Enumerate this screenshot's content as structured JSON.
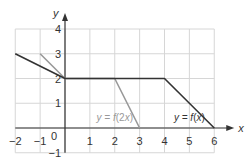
{
  "chart_data": {
    "type": "line",
    "title": "",
    "xlabel": "x",
    "ylabel": "y",
    "xlim": [
      -2,
      6
    ],
    "ylim": [
      -1,
      4
    ],
    "grid": true,
    "x_ticks": [
      -2,
      -1,
      1,
      2,
      3,
      4,
      5,
      6
    ],
    "y_ticks": [
      -1,
      1,
      2,
      3,
      4
    ],
    "origin_label": "0",
    "series": [
      {
        "name": "y = f(x)",
        "label_parts": [
          "y = ",
          "f",
          "(",
          "x",
          ")"
        ],
        "color": "#333333",
        "points": [
          [
            -2,
            3
          ],
          [
            0,
            2
          ],
          [
            4,
            2
          ],
          [
            6,
            0
          ]
        ],
        "label_position": [
          5.0,
          0.4
        ]
      },
      {
        "name": "y = f(2x)",
        "label_parts": [
          "y = ",
          "f",
          "(2",
          "x",
          ")"
        ],
        "color": "#999999",
        "points": [
          [
            -1,
            3
          ],
          [
            0,
            2
          ],
          [
            2,
            2
          ],
          [
            3,
            0
          ]
        ],
        "label_position": [
          2.0,
          0.4
        ]
      }
    ]
  },
  "colors": {
    "grid": "#d6d6d6",
    "axis": "#333333",
    "tick_label": "#333333"
  }
}
